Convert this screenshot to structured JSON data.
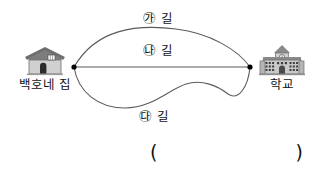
{
  "figure": {
    "nodes": [
      {
        "name": "house-node",
        "x": 74,
        "y": 67
      },
      {
        "name": "school-node",
        "x": 250,
        "y": 67
      }
    ],
    "line_color": "#5a5a5a",
    "node_color": "#000000"
  },
  "places": {
    "house": {
      "label": "백호네 집",
      "icon": "house-icon"
    },
    "school": {
      "label": "학교",
      "icon": "school-building-icon"
    }
  },
  "paths": [
    {
      "id": "ga",
      "label": "㉮ 길",
      "shape": "upper-arc"
    },
    {
      "id": "na",
      "label": "㉯ 길",
      "shape": "straight-line"
    },
    {
      "id": "da",
      "label": "㉰ 길",
      "shape": "lower-wavy-curve"
    }
  ],
  "answer": {
    "paren_open": "(",
    "paren_close": ")",
    "value": ""
  }
}
